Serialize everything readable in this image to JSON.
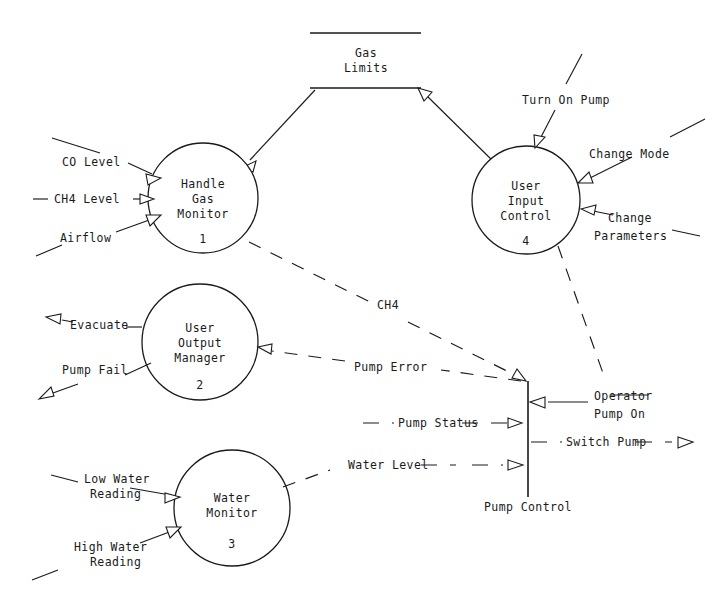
{
  "diagram": {
    "type": "data-flow-diagram",
    "background_color": "#ffffff",
    "line_color": "#1a1a1a"
  },
  "processes": [
    {
      "id": "p1",
      "number": "1",
      "name_lines": [
        "Handle",
        "Gas",
        "Monitor"
      ],
      "line1": "Handle",
      "line2": "Gas",
      "line3": "Monitor",
      "cx": 203,
      "cy": 198,
      "r": 55
    },
    {
      "id": "p2",
      "number": "2",
      "name_lines": [
        "User",
        "Output",
        "Manager"
      ],
      "line1": "User",
      "line2": "Output",
      "line3": "Manager",
      "cx": 200,
      "cy": 342,
      "r": 58
    },
    {
      "id": "p3",
      "number": "3",
      "name_lines": [
        "Water",
        "Monitor"
      ],
      "line1": "Water",
      "line2": "Monitor",
      "cx": 232,
      "cy": 508,
      "r": 58
    },
    {
      "id": "p4",
      "number": "4",
      "name_lines": [
        "User",
        "Input",
        "Control"
      ],
      "line1": "User",
      "line2": "Input",
      "line3": "Control",
      "cx": 526,
      "cy": 200,
      "r": 54
    }
  ],
  "data_stores": [
    {
      "id": "ds1",
      "name_lines": [
        "Gas",
        "Limits"
      ],
      "line1": "Gas",
      "line2": "Limits",
      "x1": 310,
      "x2": 421,
      "y_top": 33,
      "y_bottom": 88
    },
    {
      "id": "ds2",
      "name": "Pump Control",
      "label": "Pump Control",
      "x": 528,
      "y_top": 381,
      "y_bottom": 497
    }
  ],
  "flows": [
    {
      "id": "f1",
      "label": "CO Level",
      "style": "solid",
      "direction": "into-process-1"
    },
    {
      "id": "f2",
      "label": "CH4 Level",
      "style": "solid",
      "direction": "into-process-1"
    },
    {
      "id": "f3",
      "label": "Airflow",
      "style": "solid",
      "direction": "into-process-1"
    },
    {
      "id": "f4",
      "label": "Evacuate",
      "style": "solid",
      "direction": "out-of-process-2"
    },
    {
      "id": "f5",
      "label": "Pump Fail",
      "style": "solid",
      "direction": "out-of-process-2"
    },
    {
      "id": "f6",
      "label": "Low Water Reading",
      "line1": "Low Water",
      "line2": "Reading",
      "style": "solid",
      "direction": "into-process-3"
    },
    {
      "id": "f7",
      "label": "High Water Reading",
      "line1": "High Water",
      "line2": "Reading",
      "style": "solid",
      "direction": "into-process-3"
    },
    {
      "id": "f8",
      "label": "Turn On Pump",
      "style": "solid",
      "direction": "into-process-4"
    },
    {
      "id": "f9",
      "label": "Change Mode",
      "style": "solid",
      "direction": "into-process-4"
    },
    {
      "id": "f10",
      "label": "Change Parameters",
      "line1": "Change",
      "line2": "Parameters",
      "style": "solid",
      "direction": "into-process-4"
    },
    {
      "id": "f11",
      "label": "CH4",
      "style": "dashed",
      "direction": "process-1-to-pump-control"
    },
    {
      "id": "f12",
      "label": "Pump Error",
      "style": "dashed",
      "direction": "pump-control-to-process-2"
    },
    {
      "id": "f13",
      "label": "Pump Status",
      "style": "dashed",
      "direction": "into-pump-control"
    },
    {
      "id": "f14",
      "label": "Switch Pump",
      "style": "dashed",
      "direction": "out-of-pump-control"
    },
    {
      "id": "f15",
      "label": "Water Level",
      "style": "dashed",
      "direction": "process-3-to-pump-control"
    },
    {
      "id": "f16",
      "label": "Operator Pump On",
      "line1": "Operator",
      "line2": "Pump On",
      "style": "solid",
      "direction": "into-pump-control"
    }
  ],
  "labels": {
    "co_level": "CO Level",
    "ch4_level": "CH4 Level",
    "airflow": "Airflow",
    "evacuate": "Evacuate",
    "pump_fail": "Pump Fail",
    "low_water_1": "Low Water",
    "low_water_2": "Reading",
    "high_water_1": "High Water",
    "high_water_2": "Reading",
    "turn_on_pump": "Turn On Pump",
    "change_mode": "Change Mode",
    "change_params_1": "Change",
    "change_params_2": "Parameters",
    "ch4": "CH4",
    "pump_error": "Pump Error",
    "pump_status": "Pump Status",
    "switch_pump": "Switch Pump",
    "water_level": "Water Level",
    "operator_1": "Operator",
    "operator_2": "Pump On",
    "pump_control": "Pump Control",
    "gas_1": "Gas",
    "gas_2": "Limits",
    "p1_l1": "Handle",
    "p1_l2": "Gas",
    "p1_l3": "Monitor",
    "p1_num": "1",
    "p2_l1": "User",
    "p2_l2": "Output",
    "p2_l3": "Manager",
    "p2_num": "2",
    "p3_l1": "Water",
    "p3_l2": "Monitor",
    "p3_num": "3",
    "p4_l1": "User",
    "p4_l2": "Input",
    "p4_l3": "Control",
    "p4_num": "4"
  }
}
